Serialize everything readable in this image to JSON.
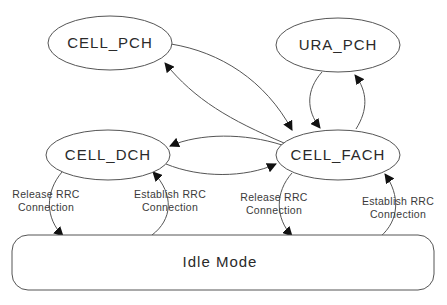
{
  "diagram": {
    "type": "state-transition",
    "states": [
      {
        "id": "cell_pch",
        "label": "CELL_PCH"
      },
      {
        "id": "ura_pch",
        "label": "URA_PCH"
      },
      {
        "id": "cell_dch",
        "label": "CELL_DCH"
      },
      {
        "id": "cell_fach",
        "label": "CELL_FACH"
      },
      {
        "id": "idle",
        "label": "Idle Mode"
      }
    ],
    "transitions": [
      {
        "from": "CELL_PCH",
        "to": "CELL_FACH",
        "label": ""
      },
      {
        "from": "CELL_FACH",
        "to": "CELL_PCH",
        "label": ""
      },
      {
        "from": "URA_PCH",
        "to": "CELL_FACH",
        "label": ""
      },
      {
        "from": "CELL_FACH",
        "to": "URA_PCH",
        "label": ""
      },
      {
        "from": "CELL_FACH",
        "to": "CELL_DCH",
        "label": ""
      },
      {
        "from": "CELL_DCH",
        "to": "CELL_FACH",
        "label": ""
      },
      {
        "from": "CELL_DCH",
        "to": "Idle Mode",
        "label_line1": "Release RRC",
        "label_line2": "Connection"
      },
      {
        "from": "Idle Mode",
        "to": "CELL_DCH",
        "label_line1": "Establish RRC",
        "label_line2": "Connection"
      },
      {
        "from": "CELL_FACH",
        "to": "Idle Mode",
        "label_line1": "Release RRC",
        "label_line2": "Connection"
      },
      {
        "from": "Idle Mode",
        "to": "CELL_FACH",
        "label_line1": "Establish RRC",
        "label_line2": "Connection"
      }
    ]
  }
}
